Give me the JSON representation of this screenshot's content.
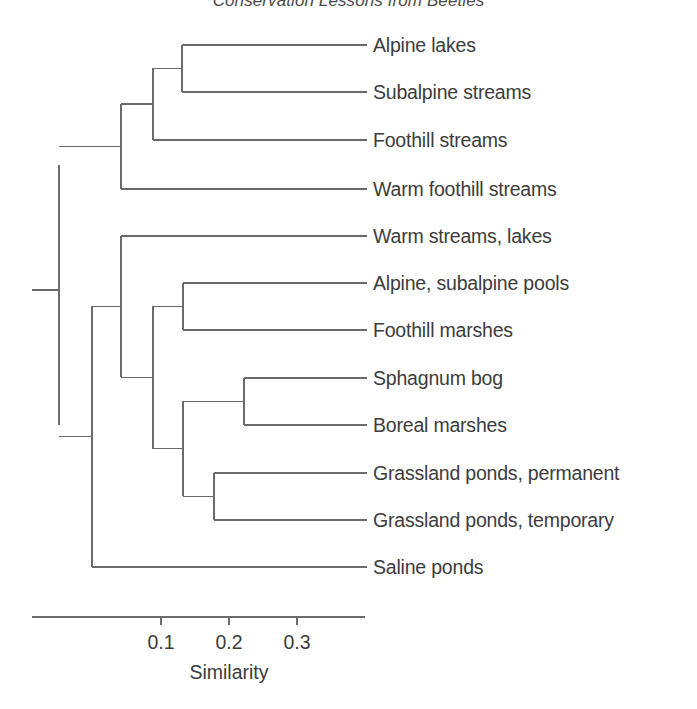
{
  "title": "Conservation Lessons from Beetles",
  "chart_data": {
    "type": "dendrogram",
    "title": "Conservation Lessons from Beetles",
    "xlabel": "Similarity",
    "ylabel": "",
    "grid": false,
    "legend": "none",
    "axis": {
      "ticks": [
        0.1,
        0.2,
        0.3
      ],
      "tick_labels": [
        "0.1",
        "0.2",
        "0.3"
      ],
      "line_from_x_px": 32,
      "line_to_x_px": 365,
      "direction": "increasing-right"
    },
    "leaves": [
      {
        "index": 0,
        "label": "Alpine lakes",
        "y_px": 45,
        "branch_x_px": 182
      },
      {
        "index": 1,
        "label": "Subalpine streams",
        "y_px": 92,
        "branch_x_px": 182
      },
      {
        "index": 2,
        "label": "Foothill streams",
        "y_px": 140,
        "branch_x_px": 153
      },
      {
        "index": 3,
        "label": "Warm foothill streams",
        "y_px": 189,
        "branch_x_px": 121
      },
      {
        "index": 4,
        "label": "Warm streams, lakes",
        "y_px": 236,
        "branch_x_px": 121
      },
      {
        "index": 5,
        "label": "Alpine, subalpine pools",
        "y_px": 283,
        "branch_x_px": 183
      },
      {
        "index": 6,
        "label": "Foothill marshes",
        "y_px": 330,
        "branch_x_px": 183
      },
      {
        "index": 7,
        "label": "Sphagnum bog",
        "y_px": 378,
        "branch_x_px": 244
      },
      {
        "index": 8,
        "label": "Boreal marshes",
        "y_px": 425,
        "branch_x_px": 244
      },
      {
        "index": 9,
        "label": "Grassland ponds, permanent",
        "y_px": 473,
        "branch_x_px": 214
      },
      {
        "index": 10,
        "label": "Grassland ponds, temporary",
        "y_px": 520,
        "branch_x_px": 214
      },
      {
        "index": 11,
        "label": "Saline ponds",
        "y_px": 567,
        "branch_x_px": 92
      }
    ],
    "merges": [
      {
        "id": "n1",
        "x_px": 182,
        "similarity": 0.131,
        "members": [
          "Alpine lakes",
          "Subalpine streams"
        ],
        "y_top": 45,
        "y_bottom": 92
      },
      {
        "id": "n2",
        "x_px": 153,
        "similarity": 0.088,
        "members": [
          "n1",
          "Foothill streams"
        ],
        "y_top": 68,
        "y_bottom": 140
      },
      {
        "id": "n3",
        "x_px": 121,
        "similarity": 0.041,
        "members": [
          "n2",
          "Warm foothill streams"
        ],
        "y_top": 104,
        "y_bottom": 189
      },
      {
        "id": "n4",
        "x_px": 183,
        "similarity": 0.132,
        "members": [
          "Alpine, subalpine pools",
          "Foothill marshes"
        ],
        "y_top": 283,
        "y_bottom": 330
      },
      {
        "id": "n5",
        "x_px": 244,
        "similarity": 0.222,
        "members": [
          "Sphagnum bog",
          "Boreal marshes"
        ],
        "y_top": 378,
        "y_bottom": 425
      },
      {
        "id": "n6",
        "x_px": 214,
        "similarity": 0.178,
        "members": [
          "Grassland ponds, permanent",
          "Grassland ponds, temporary"
        ],
        "y_top": 473,
        "y_bottom": 520
      },
      {
        "id": "n7",
        "x_px": 183,
        "similarity": 0.132,
        "members": [
          "n5",
          "n6"
        ],
        "y_top": 401,
        "y_bottom": 496
      },
      {
        "id": "n8",
        "x_px": 153,
        "similarity": 0.088,
        "members": [
          "n4",
          "n7"
        ],
        "y_top": 306,
        "y_bottom": 449
      },
      {
        "id": "n9",
        "x_px": 121,
        "similarity": 0.041,
        "members": [
          "Warm streams, lakes",
          "n8"
        ],
        "y_top": 236,
        "y_bottom": 377
      },
      {
        "id": "n10",
        "x_px": 92,
        "similarity": 0.0,
        "members": [
          "n9",
          "Saline ponds"
        ],
        "y_top": 306,
        "y_bottom": 567
      },
      {
        "id": "root",
        "x_px": 59,
        "similarity": -0.05,
        "members": [
          "n3",
          "n10"
        ],
        "y_top": 165,
        "y_bottom": 425
      }
    ],
    "root_stub": {
      "from_x_px": 32,
      "to_x_px": 59,
      "y_px": 290
    }
  }
}
